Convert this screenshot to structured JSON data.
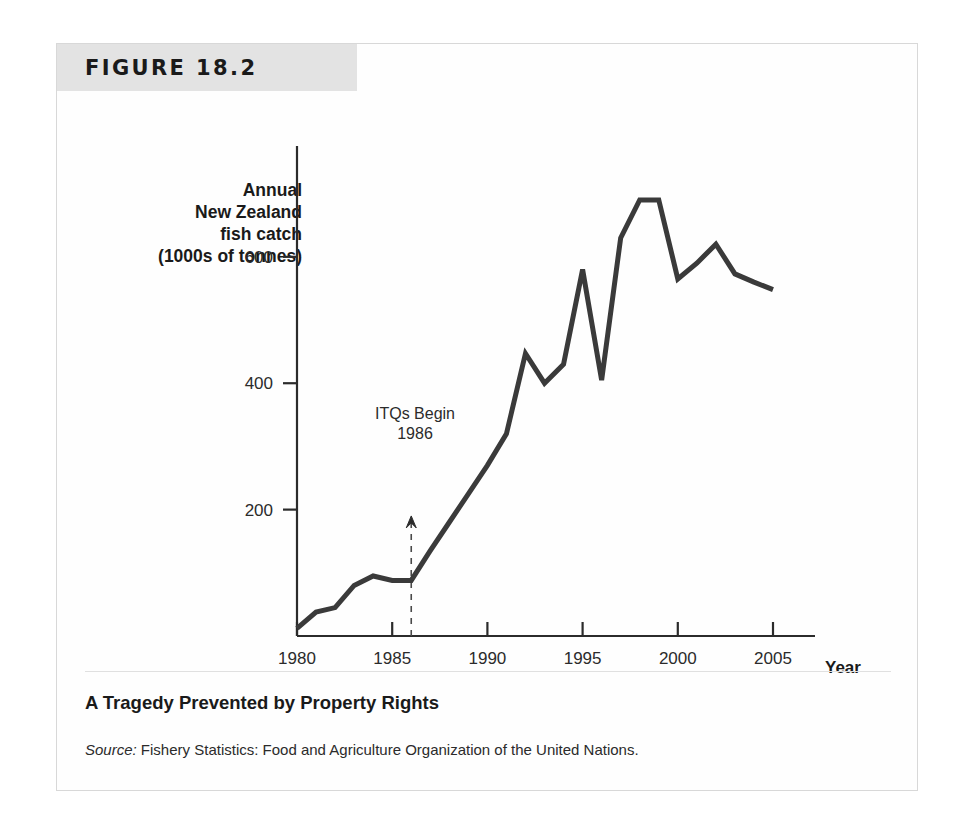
{
  "figure": {
    "header_label": "FIGURE 18.2",
    "caption_title": "A Tragedy Prevented by Property Rights",
    "source_prefix": "Source:",
    "source_text": " Fishery Statistics: Food and Agriculture Organization of the United Nations."
  },
  "axis": {
    "y_title_line1": "Annual",
    "y_title_line2": "New Zealand",
    "y_title_line3": "fish catch",
    "y_title_line4": "(1000s of tonnes)",
    "x_title": "Year"
  },
  "annotation": {
    "line1": "ITQs Begin",
    "line2": "1986",
    "marker_year": 1986
  },
  "colors": {
    "line": "#3a3a3a",
    "axis": "#2b2b2b",
    "header_band": "#e3e3e3",
    "frame_border": "#d8d8d8",
    "text": "#1a1a1a",
    "page_background": "#ffffff"
  },
  "chart_data": {
    "type": "line",
    "title": "A Tragedy Prevented by Property Rights",
    "xlabel": "Year",
    "ylabel": "Annual New Zealand fish catch (1000s of tonnes)",
    "xlim": [
      1980,
      2005
    ],
    "ylim": [
      0,
      720
    ],
    "xticks": [
      1980,
      1985,
      1990,
      1995,
      2000,
      2005
    ],
    "yticks": [
      200,
      400,
      600
    ],
    "grid": false,
    "legend": false,
    "series": [
      {
        "name": "Annual New Zealand fish catch",
        "x": [
          1980,
          1981,
          1982,
          1983,
          1984,
          1985,
          1986,
          1987,
          1988,
          1989,
          1990,
          1991,
          1992,
          1993,
          1994,
          1995,
          1996,
          1997,
          1998,
          1999,
          2000,
          2001,
          2002,
          2003,
          2004,
          2005
        ],
        "values": [
          12,
          38,
          45,
          80,
          95,
          88,
          88,
          135,
          180,
          225,
          270,
          320,
          447,
          400,
          430,
          580,
          405,
          630,
          690,
          690,
          565,
          590,
          620,
          573,
          560,
          548
        ]
      }
    ],
    "annotations": [
      {
        "text": "ITQs Begin 1986",
        "x": 1986,
        "type": "vertical-dashed-line-with-arrow"
      }
    ]
  }
}
